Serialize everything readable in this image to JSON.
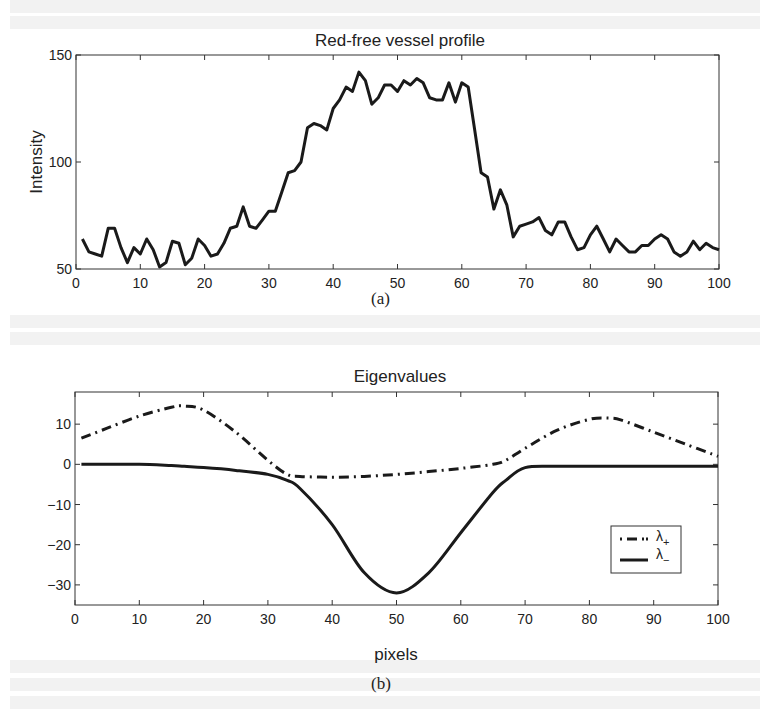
{
  "figure": {
    "caption_a": "(a)",
    "caption_b": "(b)"
  },
  "chart_data": [
    {
      "type": "line",
      "title": "Red-free vessel profile",
      "xlabel": "",
      "ylabel": "Intensity",
      "xlim": [
        0,
        100
      ],
      "ylim": [
        50,
        150
      ],
      "xticks": [
        0,
        10,
        20,
        30,
        40,
        50,
        60,
        70,
        80,
        90,
        100
      ],
      "yticks": [
        50,
        100,
        150
      ],
      "grid": false,
      "x": [
        1,
        2,
        3,
        4,
        5,
        6,
        7,
        8,
        9,
        10,
        11,
        12,
        13,
        14,
        15,
        16,
        17,
        18,
        19,
        20,
        21,
        22,
        23,
        24,
        25,
        26,
        27,
        28,
        29,
        30,
        31,
        32,
        33,
        34,
        35,
        36,
        37,
        38,
        39,
        40,
        41,
        42,
        43,
        44,
        45,
        46,
        47,
        48,
        49,
        50,
        51,
        52,
        53,
        54,
        55,
        56,
        57,
        58,
        59,
        60,
        61,
        62,
        63,
        64,
        65,
        66,
        67,
        68,
        69,
        70,
        71,
        72,
        73,
        74,
        75,
        76,
        77,
        78,
        79,
        80,
        81,
        82,
        83,
        84,
        85,
        86,
        87,
        88,
        89,
        90,
        91,
        92,
        93,
        94,
        95,
        96,
        97,
        98,
        99,
        100
      ],
      "series": [
        {
          "name": "Intensity",
          "style": "solid",
          "values": [
            64,
            58,
            57,
            56,
            69,
            69,
            60,
            53,
            60,
            57,
            64,
            59,
            51,
            53,
            63,
            62,
            52,
            55,
            64,
            61,
            56,
            57,
            62,
            69,
            70,
            79,
            70,
            69,
            73,
            77,
            77,
            86,
            95,
            96,
            100,
            116,
            118,
            117,
            115,
            125,
            129,
            135,
            133,
            142,
            138,
            127,
            130,
            136,
            136,
            133,
            138,
            136,
            139,
            137,
            130,
            129,
            129,
            137,
            128,
            137,
            135,
            115,
            95,
            93,
            78,
            87,
            80,
            65,
            70,
            71,
            72,
            74,
            68,
            66,
            72,
            72,
            65,
            59,
            60,
            66,
            70,
            64,
            58,
            64,
            61,
            58,
            58,
            61,
            61,
            64,
            66,
            64,
            58,
            56,
            58,
            63,
            59,
            62,
            60,
            59
          ]
        }
      ]
    },
    {
      "type": "line",
      "title": "Eigenvalues",
      "xlabel": "pixels",
      "ylabel": "",
      "xlim": [
        0,
        100
      ],
      "ylim": [
        -35,
        18
      ],
      "xticks": [
        0,
        10,
        20,
        30,
        40,
        50,
        60,
        70,
        80,
        90,
        100
      ],
      "yticks": [
        -30,
        -20,
        -10,
        0,
        10
      ],
      "grid": false,
      "legend_position": "lower right",
      "x": [
        1,
        5,
        10,
        15,
        17,
        20,
        25,
        30,
        33,
        35,
        40,
        45,
        50,
        55,
        60,
        65,
        67,
        70,
        75,
        80,
        83,
        85,
        90,
        95,
        100
      ],
      "series": [
        {
          "name": "λ+",
          "style": "dash-dot",
          "values": [
            6.5,
            9,
            12,
            14.2,
            14.5,
            13.5,
            8,
            1,
            -2.5,
            -3,
            -3.2,
            -3,
            -2.5,
            -1.8,
            -1,
            0,
            1,
            4,
            8.5,
            11.2,
            11.5,
            11,
            8,
            5,
            2
          ]
        },
        {
          "name": "λ−",
          "style": "solid",
          "values": [
            0,
            0,
            0,
            -0.3,
            -0.5,
            -0.8,
            -1.5,
            -2.5,
            -4,
            -6,
            -15,
            -27,
            -32,
            -27,
            -17,
            -7,
            -4,
            -0.8,
            -0.5,
            -0.5,
            -0.5,
            -0.5,
            -0.5,
            -0.5,
            -0.5
          ]
        }
      ],
      "legend": [
        {
          "label": "λ",
          "subscript": "+",
          "style": "dash-dot"
        },
        {
          "label": "λ",
          "subscript": "−",
          "style": "solid"
        }
      ]
    }
  ]
}
